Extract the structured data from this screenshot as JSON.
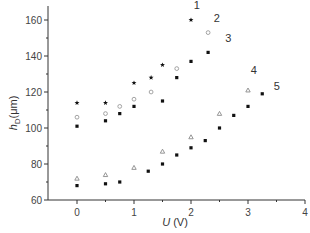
{
  "chart_data": {
    "type": "scatter",
    "title": "",
    "xlabel": "U (V)",
    "xlabel_parts": {
      "var": "U",
      "unit": " (V)"
    },
    "ylabel": "h_D(μm)",
    "ylabel_parts": {
      "var": "h",
      "sub": "D",
      "unit": "(μm)"
    },
    "xlim": [
      -0.5,
      4
    ],
    "ylim": [
      60,
      170
    ],
    "xticks": [
      0,
      1,
      2,
      3,
      4
    ],
    "yticks": [
      60,
      80,
      100,
      120,
      140,
      160
    ],
    "grid": false,
    "legend": "inline numeric labels next to series ends",
    "series": [
      {
        "name": "1",
        "marker": "star",
        "color": "#111111",
        "x": [
          0,
          0.5,
          1.0,
          1.3,
          1.5,
          2.0
        ],
        "y": [
          114,
          114,
          125,
          128,
          135,
          160
        ],
        "label_pos": [
          2.05,
          166
        ]
      },
      {
        "name": "2",
        "marker": "circle-open",
        "color": "#9a9a9a",
        "x": [
          0,
          0.5,
          0.75,
          1.0,
          1.3,
          1.75,
          2.3
        ],
        "y": [
          106,
          108,
          112,
          116,
          120,
          133,
          153
        ],
        "label_pos": [
          2.4,
          159
        ]
      },
      {
        "name": "3",
        "marker": "square",
        "color": "#111111",
        "x": [
          0,
          0.5,
          0.75,
          1.0,
          1.5,
          1.75,
          2.0,
          2.3
        ],
        "y": [
          101,
          104,
          108,
          112,
          115,
          128,
          137,
          142
        ],
        "label_pos": [
          2.6,
          148
        ]
      },
      {
        "name": "4",
        "marker": "triangle-open",
        "color": "#8a8a8a",
        "x": [
          0,
          0.5,
          1.0,
          1.5,
          2.0,
          2.5,
          3.0
        ],
        "y": [
          72,
          74,
          78,
          87,
          95,
          108,
          121
        ],
        "label_pos": [
          3.05,
          130
        ]
      },
      {
        "name": "5",
        "marker": "square",
        "color": "#111111",
        "x": [
          0,
          0.5,
          0.75,
          1.25,
          1.5,
          1.75,
          2.0,
          2.25,
          2.5,
          2.75,
          3.0,
          3.25
        ],
        "y": [
          68,
          69,
          70,
          76,
          80,
          85,
          89,
          93,
          100,
          107,
          112,
          119
        ],
        "label_pos": [
          3.45,
          121
        ]
      }
    ]
  }
}
